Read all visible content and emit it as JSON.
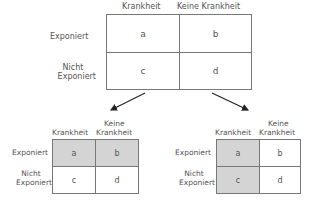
{
  "main_table": {
    "columns": [
      "Krankheit",
      "Keine Krankheit"
    ],
    "rows": [
      "Exponiert",
      "Nicht",
      "Exponiert"
    ],
    "cells": [
      "a",
      "b",
      "c",
      "d"
    ]
  },
  "left_table": {
    "col1": "Krankheit",
    "col2_line1": "Keine",
    "col2_line2": "Krankheit",
    "row1": "Exponiert",
    "row2_line1": "Nicht",
    "row2_line2": "Exponiert",
    "cells": [
      "a",
      "b",
      "c",
      "d"
    ],
    "shaded": "top row (a, b)"
  },
  "right_table": {
    "col1": "Krankheit",
    "col2_line1": "Keine",
    "col2_line2": "Krankheit",
    "row1": "Exponiert",
    "row2_line1": "Nicht",
    "row2_line2": "Exponiert",
    "cells": [
      "a",
      "b",
      "c",
      "d"
    ],
    "shaded": "left column (a, c)"
  },
  "colors": {
    "line": "#777777",
    "shade": "#d4d4d4",
    "text": "#555555"
  }
}
